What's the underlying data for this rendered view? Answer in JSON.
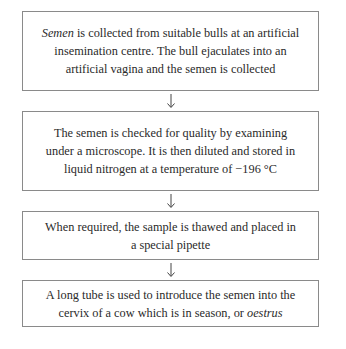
{
  "diagram": {
    "type": "flowchart",
    "direction": "top-to-bottom",
    "steps": [
      {
        "italic_lead": "Semen",
        "text": " is collected from suitable bulls at an artificial insemination centre. The bull ejaculates into an artificial vagina and the semen is collected"
      },
      {
        "text": "The semen is checked for quality by examining under a microscope. It is then diluted and stored in liquid nitrogen at a temperature of −196 °C"
      },
      {
        "text": "When required, the sample is thawed and placed in a special pipette"
      },
      {
        "text": "A long tube is used to introduce the semen into the cervix of a cow which is in season, or ",
        "italic_tail": "oestrus"
      }
    ],
    "connectors": [
      {
        "from": 0,
        "to": 1,
        "icon": "arrow-down-icon"
      },
      {
        "from": 1,
        "to": 2,
        "icon": "arrow-down-icon"
      },
      {
        "from": 2,
        "to": 3,
        "icon": "arrow-down-icon"
      }
    ],
    "colors": {
      "border": "#8a8a8a",
      "text": "#2a2a2a",
      "background": "#ffffff"
    }
  }
}
